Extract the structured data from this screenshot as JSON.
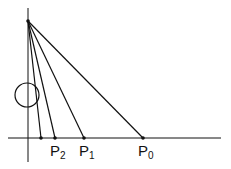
{
  "diagram": {
    "stroke_color": "#111111",
    "background": "#ffffff",
    "apex": {
      "x": 28,
      "y": 21
    },
    "vertical_axis": {
      "x": 28,
      "y1": 8,
      "y2": 162
    },
    "horizontal_axis": {
      "y": 138,
      "x1": 8,
      "x2": 221
    },
    "circle": {
      "cx": 27,
      "cy": 95,
      "r": 12
    },
    "points": [
      {
        "x": 41,
        "label": "",
        "sub": ""
      },
      {
        "x": 55,
        "label": "P",
        "sub": "2"
      },
      {
        "x": 84,
        "label": "P",
        "sub": "1"
      },
      {
        "x": 143,
        "label": "P",
        "sub": "0"
      }
    ]
  }
}
